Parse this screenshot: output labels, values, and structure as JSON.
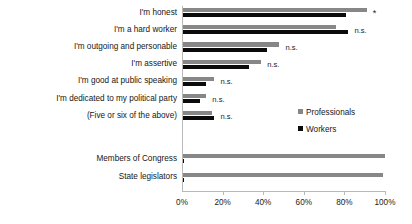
{
  "chart_data": {
    "type": "bar",
    "orientation": "horizontal",
    "title": "",
    "xlabel": "",
    "ylabel": "",
    "xlim": [
      0,
      100
    ],
    "xticks": [
      0,
      20,
      40,
      60,
      80,
      100
    ],
    "xticklabels": [
      "0%",
      "20%",
      "40%",
      "60%",
      "80%",
      "100%"
    ],
    "grid": false,
    "legend_position": "right",
    "categories": [
      "I'm honest",
      "I'm a hard worker",
      "I'm outgoing and personable",
      "I'm assertive",
      "I'm good at public speaking",
      "I'm dedicated to my political party",
      "(Five or six of the above)",
      "Members of Congress",
      "State legislators"
    ],
    "series": [
      {
        "name": "Professionals",
        "color": "#878787",
        "values": [
          91,
          76,
          48,
          39,
          16,
          12,
          15,
          100,
          99
        ]
      },
      {
        "name": "Workers",
        "color": "#0b0b0b",
        "values": [
          81,
          82,
          42,
          33,
          12,
          9,
          16,
          1,
          1
        ]
      }
    ],
    "annotations": [
      "*",
      "n.s.",
      "n.s.",
      "n.s.",
      "n.s.",
      "n.s.",
      "n.s.",
      "",
      ""
    ]
  },
  "legend": {
    "items": [
      {
        "label": "Professionals"
      },
      {
        "label": "Workers"
      }
    ]
  }
}
